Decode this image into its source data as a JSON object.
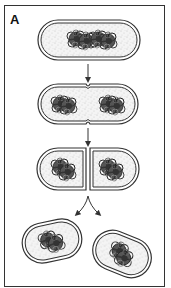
{
  "figure": {
    "panel_label": "A",
    "stages": [
      {
        "id": 1,
        "name": "parent-cell",
        "chromosomes": 2
      },
      {
        "id": 2,
        "name": "septum-forming",
        "chromosomes": 2
      },
      {
        "id": 3,
        "name": "cell-dividing",
        "chromosomes": 2
      },
      {
        "id": 4,
        "name": "daughter-cells-separated",
        "chromosomes": 2
      }
    ],
    "colors": {
      "outline": "#333333",
      "cytoplasm": "#f2f2f2",
      "stipple": "#9a9a9a",
      "chromosome": "#3a3a3a",
      "frame": "#333333"
    }
  }
}
